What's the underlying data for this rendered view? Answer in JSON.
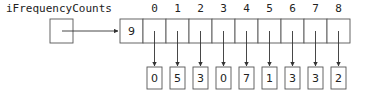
{
  "diagram": {
    "variable_name": "iFrequencyCounts",
    "array_length": "9",
    "indices": [
      "0",
      "1",
      "2",
      "3",
      "4",
      "5",
      "6",
      "7",
      "8"
    ],
    "values": [
      "0",
      "5",
      "3",
      "0",
      "7",
      "1",
      "3",
      "3",
      "2"
    ],
    "colors": {
      "stroke": "#555555",
      "text": "#222222",
      "background": "#ffffff"
    }
  }
}
